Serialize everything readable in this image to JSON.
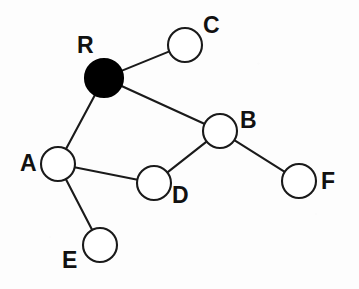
{
  "diagram": {
    "type": "node-link-graph",
    "canvas": {
      "width": 359,
      "height": 289,
      "background": "#fdfdfd"
    },
    "style": {
      "edge_color": "#1a1a1a",
      "edge_width": 2.1,
      "node_stroke": "#1a1a1a",
      "node_fill_open": "#ffffff",
      "node_fill_root": "#000000",
      "label_color": "#111111",
      "label_font_size": 23
    },
    "nodes": [
      {
        "id": "R",
        "label": "R",
        "cx": 104,
        "cy": 78,
        "r": 19,
        "filled": true,
        "label_x": 77,
        "label_y": 34,
        "role": "root"
      },
      {
        "id": "C",
        "label": "C",
        "cx": 185,
        "cy": 45,
        "r": 17,
        "filled": false,
        "label_x": 203,
        "label_y": 14,
        "role": "leaf"
      },
      {
        "id": "B",
        "label": "B",
        "cx": 220,
        "cy": 131,
        "r": 17,
        "filled": false,
        "label_x": 240,
        "label_y": 109,
        "role": "branch"
      },
      {
        "id": "A",
        "label": "A",
        "cx": 58,
        "cy": 164,
        "r": 17,
        "filled": false,
        "label_x": 20,
        "label_y": 152,
        "role": "branch"
      },
      {
        "id": "D",
        "label": "D",
        "cx": 154,
        "cy": 183,
        "r": 17,
        "filled": false,
        "label_x": 172,
        "label_y": 184,
        "role": "branch"
      },
      {
        "id": "F",
        "label": "F",
        "cx": 299,
        "cy": 181,
        "r": 17,
        "filled": false,
        "label_x": 321,
        "label_y": 170,
        "role": "leaf"
      },
      {
        "id": "E",
        "label": "E",
        "cx": 100,
        "cy": 245,
        "r": 17,
        "filled": false,
        "label_x": 62,
        "label_y": 249,
        "role": "leaf"
      }
    ],
    "edges": [
      {
        "from": "R",
        "to": "C"
      },
      {
        "from": "R",
        "to": "B"
      },
      {
        "from": "R",
        "to": "A"
      },
      {
        "from": "A",
        "to": "D"
      },
      {
        "from": "A",
        "to": "E"
      },
      {
        "from": "D",
        "to": "B"
      },
      {
        "from": "B",
        "to": "F"
      }
    ]
  }
}
